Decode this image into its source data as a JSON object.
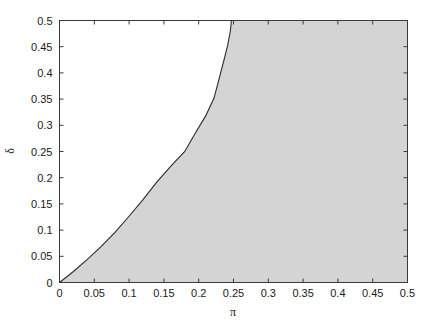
{
  "chart_data": {
    "type": "area",
    "title": "",
    "xlabel": "π",
    "ylabel": "δ",
    "xlim": [
      0,
      0.5
    ],
    "ylim": [
      0,
      0.5
    ],
    "grid": false,
    "legend": null,
    "xticks": [
      "0",
      "0.05",
      "0.1",
      "0.15",
      "0.2",
      "0.25",
      "0.3",
      "0.35",
      "0.4",
      "0.45",
      "0.5"
    ],
    "xtick_values": [
      0,
      0.05,
      0.1,
      0.15,
      0.2,
      0.25,
      0.3,
      0.35,
      0.4,
      0.45,
      0.5
    ],
    "yticks": [
      "0",
      "0.05",
      "0.1",
      "0.15",
      "0.2",
      "0.25",
      "0.3",
      "0.35",
      "0.4",
      "0.45",
      "0.5"
    ],
    "ytick_values": [
      0,
      0.05,
      0.1,
      0.15,
      0.2,
      0.25,
      0.3,
      0.35,
      0.4,
      0.45,
      0.5
    ],
    "series": [
      {
        "name": "boundary-curve",
        "color": "#2b2b2b",
        "x": [
          0.0,
          0.02,
          0.04,
          0.06,
          0.08,
          0.099,
          0.12,
          0.14,
          0.16,
          0.18,
          0.195,
          0.21,
          0.222,
          0.229,
          0.236,
          0.2415,
          0.2455,
          0.247
        ],
        "y": [
          0.0,
          0.021,
          0.044,
          0.069,
          0.096,
          0.125,
          0.158,
          0.192,
          0.222,
          0.25,
          0.285,
          0.318,
          0.352,
          0.387,
          0.423,
          0.452,
          0.48,
          0.5
        ]
      }
    ],
    "region_fill": {
      "name": "shaded-region",
      "color": "#d4d4d4",
      "description": "area to the right of the boundary curve"
    },
    "axis_color": "#3a3a3a",
    "background_color": "#ffffff"
  },
  "figure": {
    "xlabel": "π",
    "ylabel": "δ"
  }
}
